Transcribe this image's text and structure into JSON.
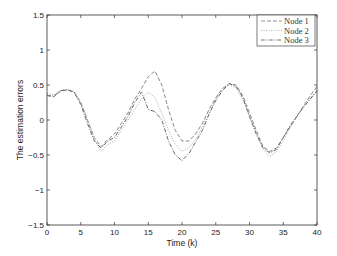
{
  "chart_data": {
    "type": "line",
    "title": "",
    "xlabel": "Time (k)",
    "ylabel": "The estimation errors",
    "xlim": [
      0,
      40
    ],
    "ylim": [
      -1.5,
      1.5
    ],
    "xticks": [
      0,
      5,
      10,
      15,
      20,
      25,
      30,
      35,
      40
    ],
    "yticks": [
      1.5,
      1,
      0.5,
      0,
      -0.5,
      -1,
      -1.5
    ],
    "ytick_labels": [
      "1.5",
      "1",
      "0.5",
      "0",
      "−0.5",
      "−1",
      "−1.5"
    ],
    "grid": false,
    "legend_position": "upper right",
    "x": [
      0,
      1,
      2,
      3,
      4,
      5,
      6,
      7,
      8,
      9,
      10,
      11,
      12,
      13,
      14,
      15,
      16,
      17,
      18,
      19,
      20,
      21,
      22,
      23,
      24,
      25,
      26,
      27,
      28,
      29,
      30,
      31,
      32,
      33,
      34,
      35,
      36,
      37,
      38,
      39,
      40
    ],
    "series": [
      {
        "name": "Node 1",
        "style": "dashed",
        "values": [
          0.35,
          0.33,
          0.41,
          0.43,
          0.4,
          0.25,
          0.0,
          -0.25,
          -0.38,
          -0.28,
          -0.2,
          -0.05,
          0.1,
          0.3,
          0.45,
          0.62,
          0.7,
          0.5,
          0.15,
          -0.15,
          -0.3,
          -0.3,
          -0.2,
          -0.05,
          0.15,
          0.32,
          0.45,
          0.52,
          0.5,
          0.35,
          0.1,
          -0.15,
          -0.38,
          -0.45,
          -0.4,
          -0.25,
          -0.1,
          0.05,
          0.2,
          0.35,
          0.48
        ]
      },
      {
        "name": "Node 2",
        "style": "dotted",
        "values": [
          0.38,
          0.36,
          0.42,
          0.44,
          0.41,
          0.26,
          0.0,
          -0.28,
          -0.45,
          -0.35,
          -0.3,
          -0.15,
          0.0,
          0.15,
          0.3,
          0.4,
          0.32,
          0.1,
          -0.15,
          -0.35,
          -0.45,
          -0.4,
          -0.28,
          -0.1,
          0.1,
          0.3,
          0.45,
          0.5,
          0.46,
          0.3,
          0.05,
          -0.2,
          -0.42,
          -0.52,
          -0.45,
          -0.3,
          -0.12,
          0.05,
          0.2,
          0.32,
          0.4
        ]
      },
      {
        "name": "Node 3",
        "style": "dashdot",
        "values": [
          0.35,
          0.34,
          0.42,
          0.43,
          0.4,
          0.22,
          -0.05,
          -0.3,
          -0.4,
          -0.3,
          -0.25,
          -0.1,
          0.05,
          0.25,
          0.4,
          0.15,
          0.12,
          0.0,
          -0.3,
          -0.5,
          -0.58,
          -0.48,
          -0.32,
          -0.15,
          0.08,
          0.28,
          0.42,
          0.52,
          0.48,
          0.32,
          0.05,
          -0.2,
          -0.4,
          -0.47,
          -0.42,
          -0.25,
          -0.08,
          0.05,
          0.18,
          0.3,
          0.42
        ]
      }
    ]
  },
  "colors": {
    "axis": "#333333",
    "node1": "#888888",
    "node2": "#aaaaaa",
    "node3": "#666666"
  }
}
